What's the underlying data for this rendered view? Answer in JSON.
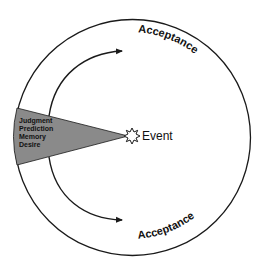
{
  "diagram": {
    "title": "",
    "wedge": {
      "labels": [
        "Judgment",
        "Prediction",
        "Memory",
        "Desire"
      ],
      "fill": "#8a8a8a"
    },
    "event": {
      "label": "Event"
    },
    "arcs": {
      "top_label": "Acceptance",
      "bottom_label": "Acceptance"
    },
    "colors": {
      "stroke": "#1a1a1a",
      "background": "#ffffff",
      "wedge_fill": "#8a8a8a"
    }
  }
}
